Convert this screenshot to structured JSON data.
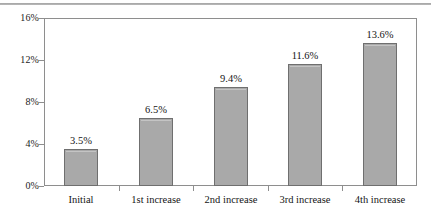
{
  "chart_data": {
    "type": "bar",
    "title": "",
    "subtitle": "",
    "xlabel": "",
    "ylabel": "",
    "categories": [
      "Initial",
      "1st increase",
      "2nd increase",
      "3rd increase",
      "4th increase"
    ],
    "values": [
      3.5,
      6.5,
      9.4,
      11.6,
      13.6
    ],
    "value_labels": [
      "3.5%",
      "6.5%",
      "9.4%",
      "11.6%",
      "13.6%"
    ],
    "ytick_labels": [
      "0%",
      "4%",
      "8%",
      "12%",
      "16%"
    ],
    "ytick_values": [
      0,
      4,
      8,
      12,
      16
    ],
    "ylim": [
      0,
      16
    ],
    "grid": false,
    "legend": false,
    "legend_position": "none",
    "bar_fill_color": "#a9a9a9",
    "bar_border_color": "#6f6f6f",
    "axis_color": "#8e8e8e",
    "text_color": "#151515"
  }
}
